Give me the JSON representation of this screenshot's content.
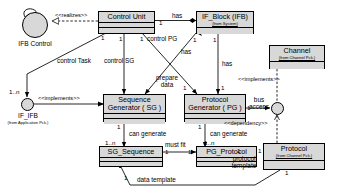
{
  "diagram": {
    "type": "uml-class-diagram",
    "background_color": "#ffffff",
    "class_fill_color": "#d8d8d8",
    "line_color": "#000000"
  },
  "classes": [
    {
      "id": "control-unit",
      "name": "Control Unit",
      "subtitle": ""
    },
    {
      "id": "if-block",
      "name": "IF_Block (IFB)",
      "subtitle": "(from System)"
    },
    {
      "id": "channel",
      "name": "Channel",
      "subtitle": "(from Channel Pck.)"
    },
    {
      "id": "sequence-generator",
      "name_line1": "Sequence",
      "name_line2": "Generator ( SG )",
      "name": "Sequence Generator ( SG )",
      "subtitle": ""
    },
    {
      "id": "protocol-generator",
      "name_line1": "Protocol",
      "name_line2": "Generator ( PG )",
      "name": "Protocol Generator ( PG )",
      "subtitle": ""
    },
    {
      "id": "sg-sequence",
      "name": "SG_Sequence",
      "subtitle": ""
    },
    {
      "id": "pg-protocol",
      "name": "PG_Protocol",
      "subtitle": ""
    },
    {
      "id": "protocol",
      "name": "Protocol",
      "subtitle": "(from Channel Pck.)"
    }
  ],
  "interfaces": [
    {
      "id": "ifb-control",
      "name": "IFB Control",
      "subtitle": ""
    },
    {
      "id": "if-ifb",
      "name": "IF_IFB",
      "subtitle": "(from Application Pck.)"
    },
    {
      "id": "bus-access-socket",
      "name": "",
      "subtitle": ""
    }
  ],
  "stereotypes": {
    "realizes": "<<realizes>>",
    "implements_ifb": "<<implements>>",
    "implements_channel": "<<implements>>",
    "dependency": "<<dependency>>"
  },
  "roles": {
    "has_cu_ifb": "has",
    "control_pg": "control PG",
    "control_sg": "control SG",
    "control_task": "control Task",
    "has_ifb_sg": "has",
    "has_ifb_pg": "has",
    "prepare_data_l1": "prepare",
    "prepare_data_l2": "data",
    "can_generate_sg": "can generate",
    "can_generate_pg": "can generate",
    "must_fit": "must fit",
    "bus_access_l1": "bus",
    "bus_access_l2": "access",
    "protocol_template_l1": "protocol",
    "protocol_template_l2": "template",
    "data_template": "data template"
  },
  "multiplicities": {
    "cu_has_1": "1",
    "cu_to_ifb_1": "1",
    "cu_bottom_left_1": "1",
    "cu_bottom_mid_1": "1",
    "cu_bottom_right_1": "1",
    "ifb_to_sg_1": "1",
    "ifb_to_pg_1": "1",
    "sg_top_1": "1",
    "pg_top_1": "1",
    "control_task_1n": "1..n",
    "sg_can_generate_1": "1",
    "sg_sequence_1n": "1..n",
    "pg_can_generate_1": "1",
    "pg_protocol_1n": "1..n",
    "sg_seq_must_fit_1": "1",
    "pg_proto_must_fit_1": "1",
    "pg_bus_1": "1",
    "pg_protocol_tmpl_1": "1",
    "protocol_tmpl_1": "1",
    "sg_seq_data_tmpl_1": "1",
    "protocol_data_tmpl_1": "1"
  }
}
